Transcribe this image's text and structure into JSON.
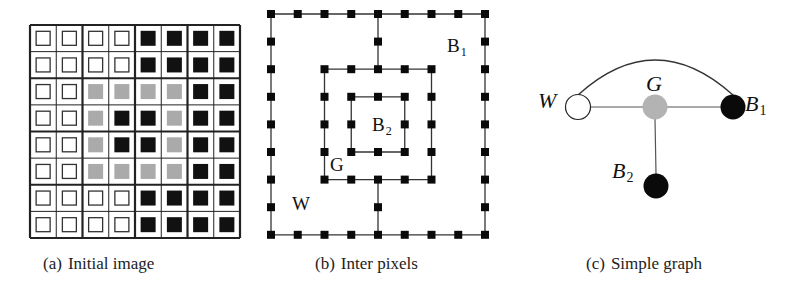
{
  "figure": {
    "panels": [
      {
        "id": "a",
        "caption_tag": "(a)",
        "caption_text": "Initial image",
        "grid_rows": [
          [
            "W",
            "W",
            "W",
            "W",
            "B",
            "B",
            "B",
            "B"
          ],
          [
            "W",
            "W",
            "W",
            "W",
            "B",
            "B",
            "B",
            "B"
          ],
          [
            "W",
            "W",
            "G",
            "G",
            "G",
            "G",
            "B",
            "B"
          ],
          [
            "W",
            "W",
            "G",
            "B",
            "B",
            "G",
            "B",
            "B"
          ],
          [
            "W",
            "W",
            "G",
            "B",
            "B",
            "G",
            "B",
            "B"
          ],
          [
            "W",
            "W",
            "G",
            "G",
            "G",
            "G",
            "B",
            "B"
          ],
          [
            "W",
            "W",
            "W",
            "W",
            "B",
            "B",
            "B",
            "B"
          ],
          [
            "W",
            "W",
            "W",
            "W",
            "B",
            "B",
            "B",
            "B"
          ]
        ],
        "legend_colors": {
          "W": "#ffffff",
          "G": "#aaaaaa",
          "B": "#111111"
        }
      },
      {
        "id": "b",
        "caption_tag": "(b)",
        "caption_text": "Inter pixels",
        "labels": {
          "B1": {
            "main": "B",
            "sub": "1"
          },
          "B2": {
            "main": "B",
            "sub": "2"
          },
          "G": {
            "main": "G"
          },
          "W": {
            "main": "W"
          }
        }
      },
      {
        "id": "c",
        "caption_tag": "(c)",
        "caption_text": "Simple graph",
        "nodes": {
          "W": {
            "main": "W",
            "fill": "#ffffff"
          },
          "G": {
            "main": "G",
            "fill": "#b3b3b3"
          },
          "B1": {
            "main": "B",
            "sub": "1",
            "fill": "#0a0a0a"
          },
          "B2": {
            "main": "B",
            "sub": "2",
            "fill": "#0a0a0a"
          }
        },
        "edges": [
          [
            "W",
            "G"
          ],
          [
            "G",
            "B1"
          ],
          [
            "G",
            "B2"
          ],
          [
            "W",
            "B1"
          ]
        ]
      }
    ]
  }
}
